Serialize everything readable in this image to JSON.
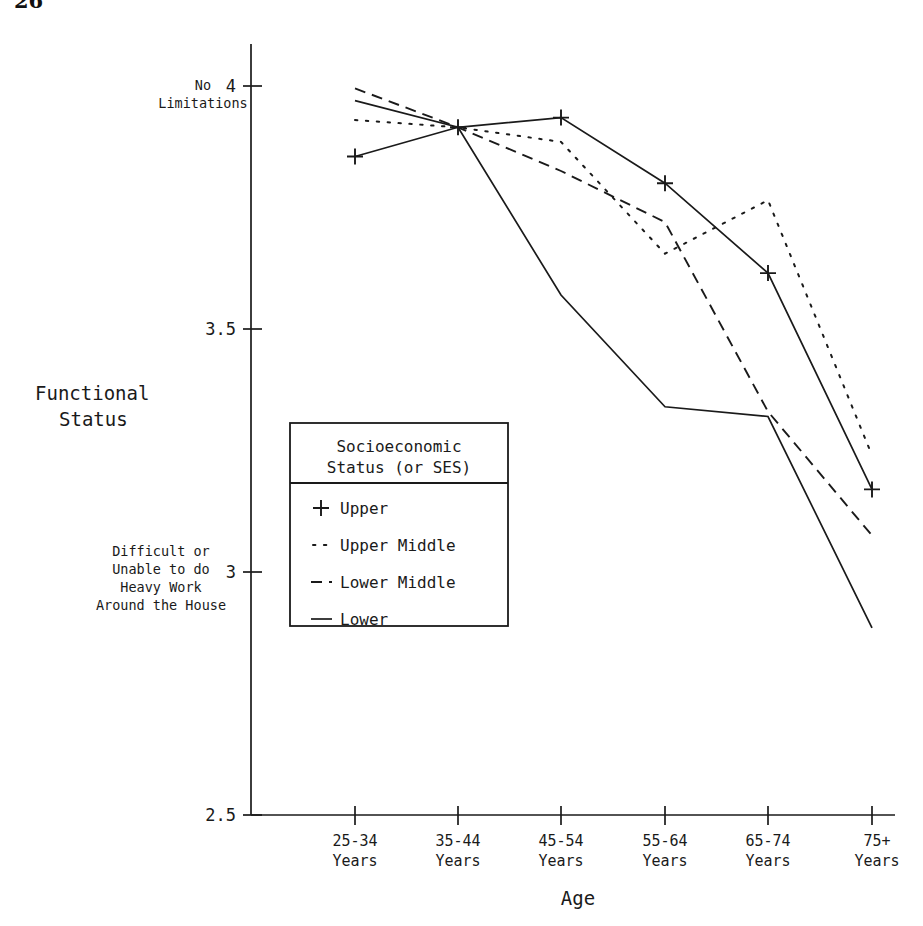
{
  "page": {
    "number": "26"
  },
  "chart_data": {
    "type": "line",
    "title": "",
    "xlabel": "Age",
    "ylabel": "Functional Status",
    "categories": [
      "25-34\nYears",
      "35-44\nYears",
      "45-54\nYears",
      "55-64\nYears",
      "65-74\nYears",
      "75+\nYears"
    ],
    "category_lines": [
      [
        "25-34",
        "Years"
      ],
      [
        "35-44",
        "Years"
      ],
      [
        "45-54",
        "Years"
      ],
      [
        "55-64",
        "Years"
      ],
      [
        "65-74",
        "Years"
      ],
      [
        "75+",
        "Years"
      ]
    ],
    "ylim": [
      2.5,
      4.0
    ],
    "yticks": [
      2.5,
      3,
      3.5,
      4
    ],
    "ytick_labels": [
      "2.5",
      "3",
      "3.5",
      "4"
    ],
    "grid": false,
    "legend_position": "center-left",
    "legend_title_lines": [
      "Socioeconomic",
      "Status (or SES)"
    ],
    "y_annotations": [
      {
        "value": 4,
        "lines": [
          "No",
          "Limitations"
        ]
      },
      {
        "value": 3,
        "lines": [
          "Difficult or",
          "Unable to do",
          "Heavy Work",
          "Around the House"
        ]
      }
    ],
    "series": [
      {
        "name": "Upper",
        "style": "solid-plus",
        "marker": "plus",
        "values": [
          3.855,
          3.915,
          3.935,
          3.8,
          3.615,
          3.17
        ]
      },
      {
        "name": "Upper Middle",
        "style": "dotted",
        "marker": "none",
        "values": [
          3.93,
          3.915,
          3.885,
          3.655,
          3.765,
          3.24
        ]
      },
      {
        "name": "Lower Middle",
        "style": "dashed",
        "marker": "none",
        "values": [
          3.995,
          3.915,
          3.825,
          3.72,
          3.33,
          3.075
        ]
      },
      {
        "name": "Lower",
        "style": "solid",
        "marker": "none",
        "values": [
          3.97,
          3.915,
          3.57,
          3.34,
          3.32,
          2.885
        ]
      }
    ]
  },
  "legend": {
    "title_line1": "Socioeconomic",
    "title_line2": "Status (or SES)",
    "items": [
      {
        "glyph": "+",
        "label": "Upper"
      },
      {
        "glyph": "··",
        "label": "Upper Middle"
      },
      {
        "glyph": "--",
        "label": "Lower Middle"
      },
      {
        "glyph": "—",
        "label": "Lower"
      }
    ]
  },
  "axes": {
    "y_title_line1": "Functional",
    "y_title_line2": "Status",
    "x_title": "Age",
    "y_tick_4": "4",
    "y_tick_35": "3.5",
    "y_tick_3": "3",
    "y_tick_25": "2.5",
    "anno_top_line1": "No",
    "anno_top_line2": "Limitations",
    "anno_bottom_line1": "Difficult or",
    "anno_bottom_line2": "Unable to do",
    "anno_bottom_line3": "Heavy Work",
    "anno_bottom_line4": "Around the House"
  }
}
